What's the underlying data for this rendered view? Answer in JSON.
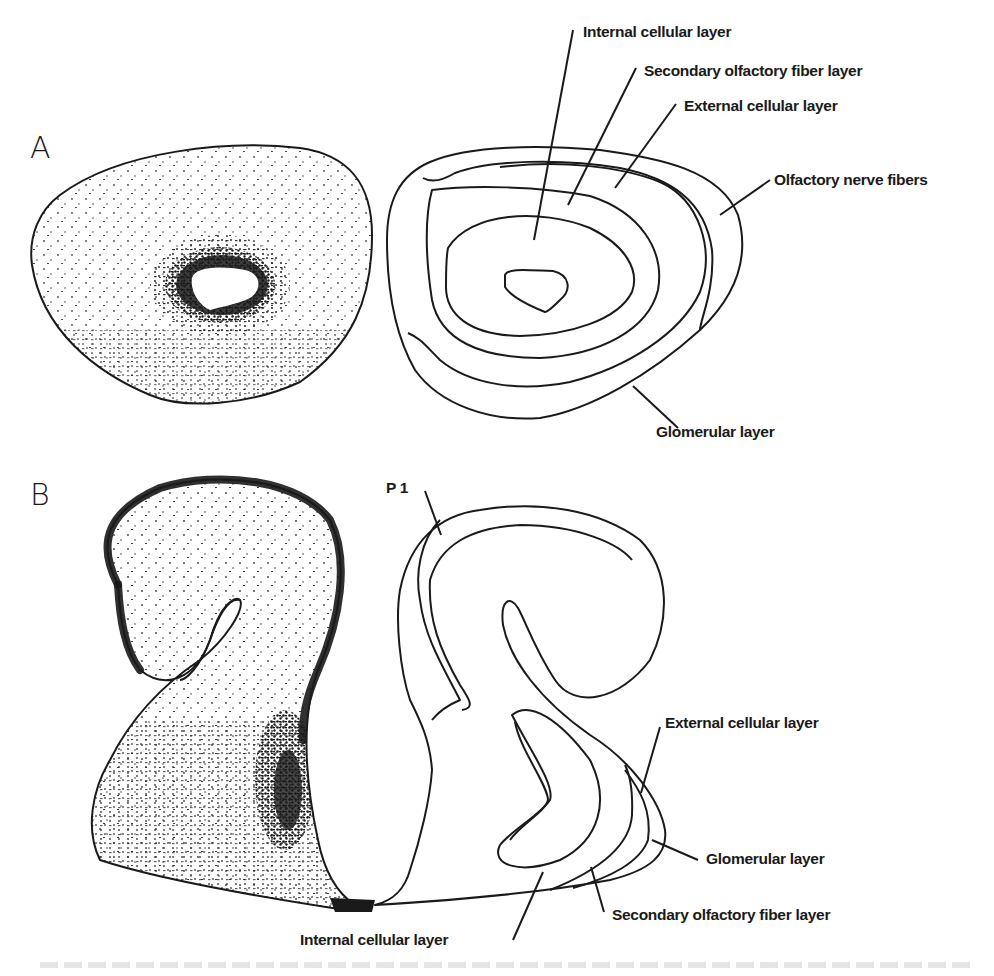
{
  "figure": {
    "panels": [
      {
        "id": "A",
        "letter": "A",
        "stained_section": "Stained cross-section (dense stippling around central ventricle)",
        "schematic_labels": [
          "Internal cellular layer",
          "Secondary olfactory fiber layer",
          "External cellular layer",
          "Olfactory nerve fibers",
          "Glomerular layer"
        ]
      },
      {
        "id": "B",
        "letter": "B",
        "age_label": "P 1",
        "stained_section": "Stained sagittal section (dense stippled rim)",
        "schematic_labels": [
          "External cellular layer",
          "Glomerular layer",
          "Secondary olfactory fiber layer",
          "Internal cellular layer"
        ]
      }
    ],
    "colors": {
      "ink": "#1a1a1a",
      "background": "#ffffff"
    }
  }
}
